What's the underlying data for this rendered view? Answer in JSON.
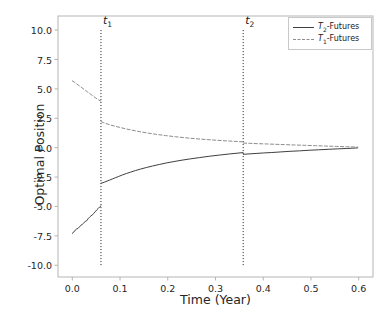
{
  "chart_data": {
    "type": "line",
    "title": "",
    "xlabel": "Time (Year)",
    "ylabel": "Optimal Position",
    "xlim": [
      -0.03,
      0.63
    ],
    "ylim": [
      -11.0,
      11.2
    ],
    "xticks": [
      0.0,
      0.1,
      0.2,
      0.3,
      0.4,
      0.5,
      0.6
    ],
    "xtick_labels": [
      "0.0",
      "0.1",
      "0.2",
      "0.3",
      "0.4",
      "0.5",
      "0.6"
    ],
    "yticks": [
      10.0,
      7.5,
      5.0,
      2.5,
      0.0,
      -2.5,
      -5.0,
      -7.5,
      -10.0
    ],
    "ytick_labels": [
      "10.0",
      "7.5",
      "5.0",
      "2.5",
      "0.0",
      "-2.5",
      "-5.0",
      "-7.5",
      "-10.0"
    ],
    "grid": false,
    "legend_position": "upper right",
    "legend": [
      {
        "label": "T2-Futures",
        "base": "T",
        "sub": "2",
        "suffix": "-Futures",
        "style": "solid",
        "color": "#3f3f3f"
      },
      {
        "label": "T1-Futures",
        "base": "T",
        "sub": "1",
        "suffix": "-Futures",
        "style": "dashed",
        "color": "#8c8c8c"
      }
    ],
    "annotations": [
      {
        "name": "t1",
        "base": "t",
        "sub": "1",
        "x": 0.06,
        "type": "vline",
        "style": "dotted",
        "color": "#1a1a1a",
        "y_top": 10.0,
        "y_bottom": -10.0
      },
      {
        "name": "t2",
        "base": "t",
        "sub": "2",
        "x": 0.358,
        "type": "vline",
        "style": "dotted",
        "color": "#1a1a1a",
        "y_top": 10.0,
        "y_bottom": -10.0
      }
    ],
    "series": [
      {
        "name": "T2-Futures",
        "style": "solid",
        "color": "#3f3f3f",
        "segments": [
          {
            "x": [
              0.0,
              0.003,
              0.006,
              0.009,
              0.012,
              0.015,
              0.018,
              0.021,
              0.024,
              0.027,
              0.03,
              0.033,
              0.036,
              0.039,
              0.042,
              0.045,
              0.048,
              0.051,
              0.054,
              0.057,
              0.0598
            ],
            "y": [
              -7.28,
              -7.18,
              -7.02,
              -6.92,
              -6.86,
              -6.74,
              -6.6,
              -6.52,
              -6.4,
              -6.28,
              -6.22,
              -6.05,
              -5.92,
              -5.8,
              -5.72,
              -5.58,
              -5.45,
              -5.3,
              -5.18,
              -5.05,
              -4.96
            ]
          },
          {
            "x": [
              0.0602,
              0.064,
              0.068,
              0.073,
              0.078,
              0.084,
              0.09,
              0.097,
              0.105,
              0.113,
              0.122,
              0.132,
              0.143,
              0.155,
              0.168,
              0.182,
              0.197,
              0.213,
              0.23,
              0.248,
              0.267,
              0.287,
              0.308,
              0.33,
              0.3576
            ],
            "y": [
              -3.02,
              -2.98,
              -2.92,
              -2.84,
              -2.76,
              -2.66,
              -2.56,
              -2.45,
              -2.32,
              -2.2,
              -2.08,
              -1.95,
              -1.82,
              -1.69,
              -1.56,
              -1.43,
              -1.3,
              -1.18,
              -1.06,
              -0.95,
              -0.84,
              -0.73,
              -0.63,
              -0.53,
              -0.42
            ]
          },
          {
            "x": [
              0.3584,
              0.37,
              0.385,
              0.4,
              0.418,
              0.437,
              0.456,
              0.476,
              0.496,
              0.516,
              0.536,
              0.556,
              0.574,
              0.588,
              0.598
            ],
            "y": [
              -0.56,
              -0.53,
              -0.49,
              -0.45,
              -0.41,
              -0.36,
              -0.31,
              -0.27,
              -0.22,
              -0.18,
              -0.14,
              -0.1,
              -0.07,
              -0.04,
              -0.02
            ]
          }
        ]
      },
      {
        "name": "T1-Futures",
        "style": "dashed",
        "color": "#8c8c8c",
        "segments": [
          {
            "x": [
              0.0,
              0.004,
              0.008,
              0.012,
              0.016,
              0.02,
              0.024,
              0.028,
              0.032,
              0.036,
              0.04,
              0.044,
              0.048,
              0.052,
              0.056,
              0.0598
            ],
            "y": [
              5.68,
              5.58,
              5.45,
              5.34,
              5.22,
              5.1,
              4.98,
              4.86,
              4.74,
              4.62,
              4.5,
              4.38,
              4.26,
              4.14,
              4.04,
              3.96
            ]
          },
          {
            "x": [
              0.0602,
              0.066,
              0.073,
              0.081,
              0.09,
              0.1,
              0.112,
              0.125,
              0.14,
              0.157,
              0.175,
              0.195,
              0.216,
              0.24,
              0.265,
              0.292,
              0.322,
              0.3576
            ],
            "y": [
              2.22,
              2.12,
              2.02,
              1.92,
              1.82,
              1.72,
              1.6,
              1.49,
              1.37,
              1.25,
              1.14,
              1.03,
              0.93,
              0.83,
              0.74,
              0.66,
              0.58,
              0.5
            ]
          },
          {
            "x": [
              0.3584,
              0.372,
              0.388,
              0.405,
              0.424,
              0.444,
              0.465,
              0.487,
              0.509,
              0.531,
              0.553,
              0.574,
              0.59,
              0.598
            ],
            "y": [
              0.39,
              0.37,
              0.34,
              0.32,
              0.29,
              0.26,
              0.23,
              0.2,
              0.17,
              0.14,
              0.11,
              0.08,
              0.06,
              0.05
            ]
          }
        ]
      }
    ]
  },
  "axes": {
    "spine_color": "#b5b5b5",
    "background": "#ffffff"
  }
}
